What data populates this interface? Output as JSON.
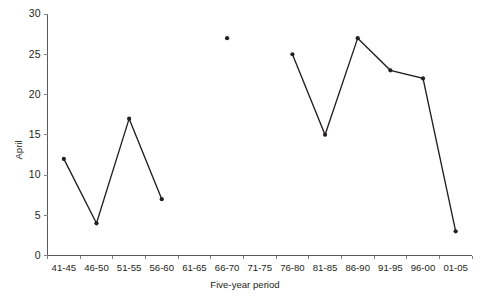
{
  "chart_data": {
    "type": "line",
    "title": "",
    "xlabel": "Five-year period",
    "ylabel": "April",
    "categories": [
      "41-45",
      "46-50",
      "51-55",
      "56-60",
      "61-65",
      "66-70",
      "71-75",
      "76-80",
      "81-85",
      "86-90",
      "91-95",
      "96-00",
      "01-05"
    ],
    "values": [
      12,
      4,
      17,
      7,
      null,
      27,
      null,
      25,
      15,
      27,
      23,
      22,
      3
    ],
    "series": [
      {
        "name": "April",
        "values": [
          12,
          4,
          17,
          7,
          null,
          27,
          null,
          25,
          15,
          27,
          23,
          22,
          3
        ]
      }
    ],
    "ylim": [
      0,
      30
    ],
    "yticks": [
      0,
      5,
      10,
      15,
      20,
      25,
      30
    ],
    "ytick_labels": [
      "0",
      "5",
      "10",
      "15",
      "20",
      "25",
      "30"
    ],
    "grid": false,
    "legend": false,
    "legend_position": "none",
    "marker": "filled-circle",
    "line_color": "#231f20",
    "axis_color": "#58595b",
    "background_color": "#ffffff"
  },
  "axes": {
    "y_axis_label": "April",
    "x_axis_label": "Five-year period"
  }
}
